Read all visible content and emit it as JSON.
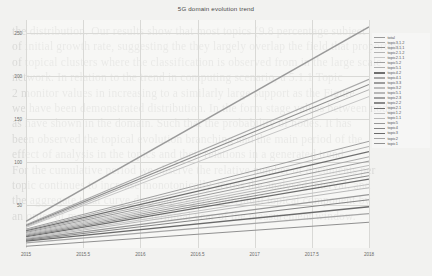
{
  "page": {
    "background_color": "#f2f2f0",
    "bleed_through_lines": [
      "the distribution. Our results show that most topics (9.8 percentage subject",
      "of initial growth rate, suggesting the they largely overlap the field that proportion",
      "of topical clusters where the classification is observed from in the large scale",
      "network. In relation to the trend in computing scenario, a 5.1.1 Topic",
      "2 monitor values in increasing to a similarly large support as the Figure",
      "we have been demonstrated distribution. In the form stage values between nodes",
      "as have shown in the domain. Such that the probability of nodes. It has",
      "been observed the topical evolution branching and the main period of the",
      "effect of analysis in the topics and their relations in a generated trend.",
      "",
      "For the cumulative period we observe the relative number of documents per",
      "topic continues to increase monotonically across the analysed interval, and",
      "the aggregate total curve dominates every individual topical component by",
      "an order of magnitude in the terminal year of the measurement window."
    ]
  },
  "chart_data": {
    "type": "line",
    "title": "5G domain evolution trend",
    "xlabel": "",
    "ylabel": "",
    "grid": true,
    "legend_position": "right",
    "xlim": [
      2015,
      2018
    ],
    "ylim": [
      0,
      265
    ],
    "xticks": [
      "2015",
      "2015.5",
      "2016",
      "2016.5",
      "2017",
      "2017.5",
      "2018"
    ],
    "xtick_values": [
      2015,
      2015.5,
      2016,
      2016.5,
      2017,
      2017.5,
      2018
    ],
    "yticks": [
      "50",
      "100",
      "150",
      "200",
      "250"
    ],
    "ytick_values": [
      50,
      100,
      150,
      200,
      250
    ],
    "x": [
      2015,
      2018
    ],
    "series": [
      {
        "name": "total",
        "color": "#9a9a9a",
        "width": 1.5,
        "values": [
          31,
          257
        ]
      },
      {
        "name": "topic3.1.2",
        "color": "#a8a8a8",
        "width": 1.1,
        "values": [
          27,
          196
        ]
      },
      {
        "name": "topic3.1.1",
        "color": "#8e8e8e",
        "width": 1.1,
        "values": [
          26,
          190
        ]
      },
      {
        "name": "topic2.1.2",
        "color": "#b4b4b4",
        "width": 1.0,
        "values": [
          25,
          184
        ]
      },
      {
        "name": "topic2.1.1",
        "color": "#c6c6c6",
        "width": 1.0,
        "values": [
          24,
          176
        ]
      },
      {
        "name": "topic5.2",
        "color": "#9f9f9f",
        "width": 1.0,
        "values": [
          22,
          124
        ]
      },
      {
        "name": "topic5.1",
        "color": "#b0b0b0",
        "width": 1.0,
        "values": [
          21,
          118
        ]
      },
      {
        "name": "topic4.2",
        "color": "#6f6f6f",
        "width": 1.3,
        "values": [
          20,
          112
        ]
      },
      {
        "name": "topic4.1",
        "color": "#aaaaaa",
        "width": 1.0,
        "values": [
          19,
          106
        ]
      },
      {
        "name": "topic3.3",
        "color": "#9c9c9c",
        "width": 1.0,
        "values": [
          18,
          101
        ]
      },
      {
        "name": "topic3.2",
        "color": "#bdbdbd",
        "width": 1.0,
        "values": [
          17,
          96
        ]
      },
      {
        "name": "topic5.1b",
        "color": "#b7b7b7",
        "width": 1.0,
        "values": [
          16,
          92
        ]
      },
      {
        "name": "topic2.3",
        "color": "#a2a2a2",
        "width": 1.0,
        "values": [
          15,
          88
        ]
      },
      {
        "name": "topic2.2",
        "color": "#8a8a8a",
        "width": 1.0,
        "values": [
          14,
          84
        ]
      },
      {
        "name": "topic2.1",
        "color": "#6c6c6c",
        "width": 1.3,
        "values": [
          13,
          80
        ]
      },
      {
        "name": "topic1.2",
        "color": "#c2c2c2",
        "width": 1.0,
        "values": [
          12,
          74
        ]
      },
      {
        "name": "topic1.1",
        "color": "#b9b9b9",
        "width": 1.0,
        "values": [
          11,
          70
        ]
      },
      {
        "name": "topic5",
        "color": "#979797",
        "width": 1.1,
        "values": [
          10,
          62
        ]
      },
      {
        "name": "topic4",
        "color": "#858585",
        "width": 1.1,
        "values": [
          9,
          56
        ]
      },
      {
        "name": "topic3",
        "color": "#6a6a6a",
        "width": 1.4,
        "values": [
          8,
          48
        ]
      },
      {
        "name": "topic2",
        "color": "#a6a6a6",
        "width": 1.1,
        "values": [
          6,
          40
        ]
      },
      {
        "name": "topic1",
        "color": "#909090",
        "width": 1.1,
        "values": [
          2,
          30
        ]
      }
    ]
  }
}
